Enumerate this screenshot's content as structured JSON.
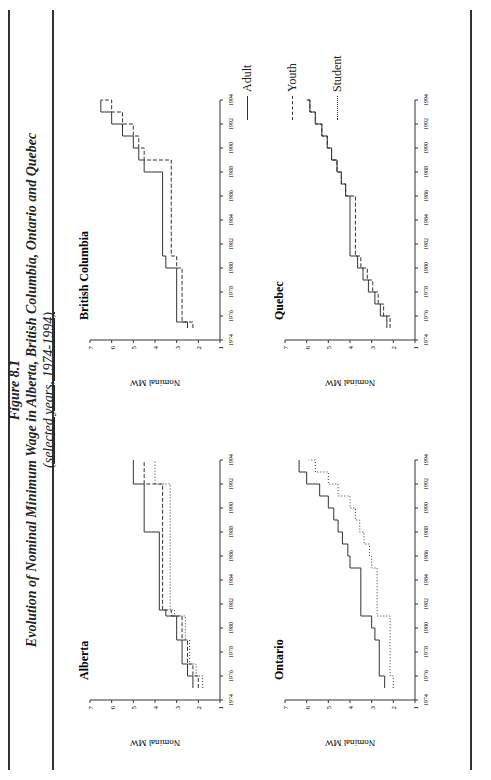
{
  "figure": {
    "label": "Figure 8.1",
    "title": "Evolution of Nominal Minimum Wage in Alberta, British Columbia, Ontario and Quebec",
    "subtitle": "(selected years, 1974-1994)"
  },
  "legend": [
    {
      "name": "Adult",
      "style": "solid"
    },
    {
      "name": "Youth",
      "style": "dashed"
    },
    {
      "name": "Student",
      "style": "dotted"
    }
  ],
  "axis": {
    "ylabel": "Nominal MW",
    "yticks": [
      "1",
      "2",
      "3",
      "4",
      "5",
      "6",
      "7"
    ],
    "xticks": [
      "1974",
      "1976",
      "1978",
      "1980",
      "1982",
      "1984",
      "1986",
      "1988",
      "1990",
      "1992",
      "1994"
    ]
  },
  "chart_data": [
    {
      "type": "line",
      "title": "Alberta",
      "xlabel": "",
      "ylabel": "Nominal MW",
      "ylim": [
        1,
        7
      ],
      "xlim": [
        1974,
        1994
      ],
      "x": [
        1975,
        1976,
        1977,
        1979,
        1981,
        1981.5,
        1988,
        1992,
        1994
      ],
      "series": [
        {
          "name": "Adult",
          "values": [
            2.25,
            2.5,
            2.75,
            3.0,
            3.5,
            3.8,
            4.5,
            5.0,
            5.0
          ]
        },
        {
          "name": "Youth",
          "values": [
            2.0,
            2.25,
            2.5,
            2.75,
            3.25,
            3.65,
            3.65,
            4.5,
            4.5
          ]
        },
        {
          "name": "Student",
          "values": [
            1.8,
            2.1,
            2.4,
            2.6,
            3.1,
            3.3,
            3.3,
            4.0,
            4.0
          ]
        }
      ]
    },
    {
      "type": "line",
      "title": "British Columbia",
      "xlabel": "",
      "ylabel": "Nominal MW",
      "ylim": [
        1,
        7
      ],
      "xlim": [
        1974,
        1994
      ],
      "x": [
        1975,
        1975.5,
        1980,
        1981,
        1988,
        1989,
        1990,
        1991,
        1992,
        1993,
        1994
      ],
      "series": [
        {
          "name": "Adult",
          "values": [
            2.5,
            3.0,
            3.5,
            3.65,
            4.5,
            4.75,
            5.0,
            5.5,
            6.0,
            6.5,
            6.5
          ]
        },
        {
          "name": "Youth",
          "values": [
            2.25,
            2.75,
            3.0,
            3.25,
            3.25,
            4.5,
            4.75,
            5.0,
            5.5,
            6.0,
            6.5
          ]
        }
      ]
    },
    {
      "type": "line",
      "title": "Ontario",
      "xlabel": "",
      "ylabel": "Nominal MW",
      "ylim": [
        1,
        7
      ],
      "xlim": [
        1974,
        1994
      ],
      "x": [
        1975,
        1976,
        1979,
        1980,
        1981,
        1984,
        1985,
        1986,
        1987,
        1988,
        1989,
        1990,
        1991,
        1992,
        1993,
        1994
      ],
      "series": [
        {
          "name": "Adult",
          "values": [
            2.4,
            2.65,
            2.85,
            3.0,
            3.5,
            3.5,
            4.0,
            4.1,
            4.35,
            4.55,
            4.75,
            5.0,
            5.4,
            6.0,
            6.35,
            6.35
          ]
        },
        {
          "name": "Student",
          "values": [
            2.0,
            2.15,
            2.15,
            2.15,
            2.75,
            2.75,
            3.0,
            3.1,
            3.35,
            3.55,
            3.75,
            4.0,
            4.55,
            5.0,
            5.6,
            5.9
          ]
        }
      ]
    },
    {
      "type": "line",
      "title": "Quebec",
      "xlabel": "",
      "ylabel": "Nominal MW",
      "ylim": [
        1,
        7
      ],
      "xlim": [
        1974,
        1994
      ],
      "x": [
        1975,
        1976,
        1977,
        1978,
        1979,
        1980,
        1981,
        1986,
        1987,
        1988,
        1989,
        1990,
        1991,
        1992,
        1993,
        1994
      ],
      "series": [
        {
          "name": "Adult",
          "values": [
            2.3,
            2.6,
            2.85,
            3.15,
            3.4,
            3.65,
            4.0,
            4.2,
            4.4,
            4.6,
            4.85,
            5.05,
            5.3,
            5.6,
            5.85,
            6.0
          ]
        },
        {
          "name": "Youth",
          "values": [
            2.15,
            2.45,
            2.7,
            2.95,
            3.2,
            3.5,
            3.75,
            4.2,
            4.4,
            4.6,
            4.85,
            5.05,
            5.3,
            5.6,
            5.85,
            6.0
          ]
        }
      ]
    }
  ]
}
